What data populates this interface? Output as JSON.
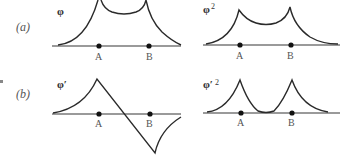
{
  "figure": {
    "rows": [
      {
        "label": "(a)",
        "panels": [
          {
            "function_label": "φ",
            "superscript": "",
            "points": [
              "A",
              "B"
            ]
          },
          {
            "function_label": "φ",
            "superscript": "2",
            "points": [
              "A",
              "B"
            ]
          }
        ]
      },
      {
        "label": "(b)",
        "panels": [
          {
            "function_label": "φ′",
            "superscript": "",
            "points": [
              "A",
              "B"
            ]
          },
          {
            "function_label": "φ′",
            "superscript": "2",
            "points": [
              "A",
              "B"
            ]
          }
        ]
      }
    ]
  }
}
